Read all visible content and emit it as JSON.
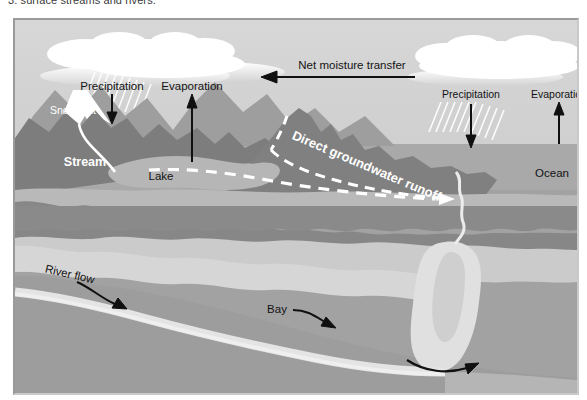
{
  "caption": {
    "text": "3. surface streams and rivers."
  },
  "figure": {
    "name": "hydrologic-cycle-coastal-diagram",
    "frame_color": "#9a9a9a",
    "palette": {
      "sky": "#d3d3d3",
      "cloud": "#ffffff",
      "ocean_surface": "#a8a8a8",
      "water_body": "#b4b4b4",
      "mountain_far": "#9b9b9b",
      "mountain_near": "#7f7f7f",
      "land_dark": "#8c8c8c",
      "shoal_light": "#cfcfcf",
      "channel_light": "#e2e2e2",
      "arrow_dark": "#101010",
      "arrow_white": "#ffffff"
    },
    "labels": [
      {
        "id": "precipitation-left",
        "text": "Precipitation",
        "x": 97,
        "y": 66,
        "color": "dark",
        "anchor": "middle",
        "size": 11,
        "rotate": 0
      },
      {
        "id": "evaporation-left",
        "text": "Evaporation",
        "x": 177,
        "y": 67,
        "color": "dark",
        "anchor": "middle",
        "size": 11,
        "rotate": 0
      },
      {
        "id": "snowmelt",
        "text": "Snowmelt",
        "x": 58,
        "y": 92,
        "color": "white",
        "anchor": "middle",
        "size": 10,
        "rotate": 0
      },
      {
        "id": "stream",
        "text": "Stream",
        "x": 68,
        "y": 143,
        "color": "white",
        "anchor": "middle",
        "size": 12,
        "rotate": 0
      },
      {
        "id": "lake",
        "text": "Lake",
        "x": 144,
        "y": 156,
        "color": "dark",
        "anchor": "middle",
        "size": 11,
        "rotate": 0
      },
      {
        "id": "net-moisture-transfer",
        "text": "Net moisture transfer",
        "x": 337,
        "y": 47,
        "color": "dark",
        "anchor": "middle",
        "size": 11,
        "rotate": 0
      },
      {
        "id": "precipitation-right",
        "text": "Precipitation",
        "x": 456,
        "y": 75,
        "color": "dark",
        "anchor": "middle",
        "size": 10,
        "rotate": 0
      },
      {
        "id": "evaporation-right",
        "text": "Evaporation",
        "x": 544,
        "y": 75,
        "color": "dark",
        "anchor": "middle",
        "size": 10,
        "rotate": 0
      },
      {
        "id": "ocean",
        "text": "Ocean",
        "x": 537,
        "y": 155,
        "color": "dark",
        "anchor": "middle",
        "size": 11,
        "rotate": 0
      },
      {
        "id": "direct-groundwater-runoff",
        "text": "Direct groundwater runoff",
        "x": 350,
        "y": 147,
        "color": "white",
        "anchor": "middle",
        "size": 12,
        "rotate": 23
      },
      {
        "id": "river-flow",
        "text": "River flow",
        "x": 55,
        "y": 258,
        "color": "dark",
        "anchor": "middle",
        "size": 11,
        "rotate": 12
      },
      {
        "id": "bay",
        "text": "Bay",
        "x": 261,
        "y": 291,
        "color": "dark",
        "anchor": "middle",
        "size": 11,
        "rotate": 0
      }
    ],
    "arrows": [
      {
        "id": "precipitation-left-arrow",
        "kind": "straight-down",
        "color": "dark"
      },
      {
        "id": "evaporation-left-arrow",
        "kind": "straight-up",
        "color": "dark"
      },
      {
        "id": "net-moisture-transfer-arrow",
        "kind": "straight-left",
        "color": "dark"
      },
      {
        "id": "precipitation-right-arrow",
        "kind": "straight-down",
        "color": "dark"
      },
      {
        "id": "evaporation-right-arrow",
        "kind": "straight-up",
        "color": "dark"
      },
      {
        "id": "groundwater-runoff-arrow",
        "kind": "dashed-right",
        "color": "white"
      },
      {
        "id": "river-flow-arrow",
        "kind": "curved-right",
        "color": "dark"
      },
      {
        "id": "bay-arrow",
        "kind": "curved-right",
        "color": "dark"
      },
      {
        "id": "estuary-mouth-arrow",
        "kind": "curved-right",
        "color": "dark"
      }
    ]
  }
}
